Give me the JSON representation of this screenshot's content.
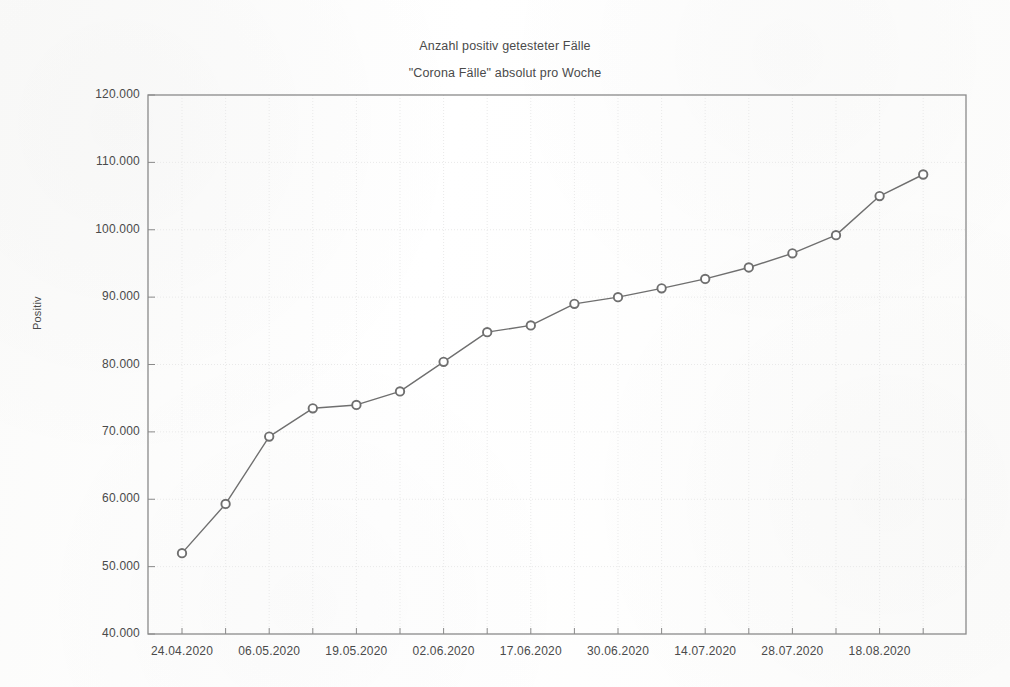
{
  "chart_data": {
    "type": "line",
    "title": "Anzahl positiv getesteter Fälle",
    "subtitle": "\"Corona Fälle\" absolut pro Woche",
    "xlabel": "",
    "ylabel": "Positiv",
    "ylim": [
      40000,
      120000
    ],
    "ytick_step": 10000,
    "grid": true,
    "legend": false,
    "marker": "open-circle",
    "line_color": "#6f6f6f",
    "marker_color": "#6f6f6f",
    "grid_color": "#e9e9e9",
    "axis_color": "#8a8a8a",
    "ytick_labels": [
      "120.000",
      "110.000",
      "100.000",
      "90.000",
      "80.000",
      "70.000",
      "60.000",
      "50.000",
      "40.000"
    ],
    "ytick_values": [
      120000,
      110000,
      100000,
      90000,
      80000,
      70000,
      60000,
      50000,
      40000
    ],
    "xtick_labels": [
      "24.04.2020",
      "06.05.2020",
      "19.05.2020",
      "02.06.2020",
      "17.06.2020",
      "30.06.2020",
      "14.07.2020",
      "28.07.2020",
      "18.08.2020"
    ],
    "x": [
      "24.04.2020",
      "30.04.2020",
      "06.05.2020",
      "12.05.2020",
      "19.05.2020",
      "26.05.2020",
      "02.06.2020",
      "09.06.2020",
      "17.06.2020",
      "23.06.2020",
      "30.06.2020",
      "07.07.2020",
      "14.07.2020",
      "21.07.2020",
      "28.07.2020",
      "04.08.2020",
      "11.08.2020",
      "18.08.2020"
    ],
    "values": [
      52000,
      59300,
      69300,
      73500,
      74000,
      76000,
      80400,
      84800,
      85800,
      89000,
      90000,
      91300,
      92700,
      94400,
      96500,
      99200,
      105000,
      108200
    ],
    "series": [
      {
        "name": "Positiv",
        "values": [
          52000,
          59300,
          69300,
          73500,
          74000,
          76000,
          80400,
          84800,
          85800,
          89000,
          90000,
          91300,
          92700,
          94400,
          96500,
          99200,
          105000,
          108200
        ]
      }
    ]
  }
}
